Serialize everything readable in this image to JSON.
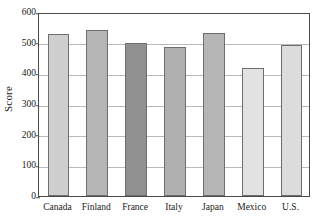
{
  "chart_data": {
    "type": "bar",
    "title": "",
    "subtitle": "",
    "xlabel": "",
    "ylabel": "Score",
    "categories": [
      "Canada",
      "Finland",
      "France",
      "Italy",
      "Japan",
      "Mexico",
      "U.S."
    ],
    "values": [
      528,
      541,
      500,
      486,
      531,
      418,
      492
    ],
    "bar_colors": [
      "#cfcfcf",
      "#b5b5b5",
      "#909090",
      "#b0b0b0",
      "#b5b5b5",
      "#e2e2e2",
      "#dcdcdc"
    ],
    "bar_edge_color": "#6e6e6e",
    "ylim": [
      0,
      600
    ],
    "yticks": [
      0,
      100,
      200,
      300,
      400,
      500,
      600
    ],
    "ytick_labels": [
      "0",
      "100",
      "200",
      "300",
      "400",
      "500",
      "600"
    ],
    "grid": true,
    "grid_color": "#b9b9b9",
    "legend": false,
    "legend_position": "none",
    "axis_color": "#4a4a4a",
    "background": "#ffffff"
  }
}
